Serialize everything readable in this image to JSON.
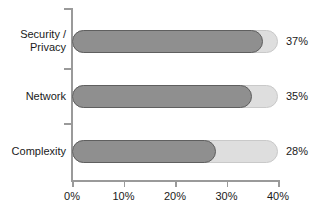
{
  "chart_data": {
    "type": "bar",
    "orientation": "horizontal",
    "title": "",
    "subtitle": "",
    "xlabel": "",
    "ylabel": "",
    "categories": [
      "Security / Privacy",
      "Network",
      "Complexity"
    ],
    "values": [
      37,
      35,
      28
    ],
    "value_labels": [
      "37%",
      "35%",
      "28%"
    ],
    "xlim": [
      0,
      40
    ],
    "xticks": [
      0,
      10,
      20,
      30,
      40
    ],
    "xtick_labels": [
      "0%",
      "10%",
      "20%",
      "30%",
      "40%"
    ],
    "grid": false,
    "legend": null,
    "colors": {
      "bar_fill": "#8f8f8f",
      "bar_outline": "#5f5f5f",
      "track_fill": "#dedede",
      "track_outline": "#c9c9c9",
      "axis": "#9a9a9a",
      "text": "#1a1a1a",
      "background": "#ffffff"
    }
  },
  "categories": {
    "security_privacy": {
      "line1": "Security /",
      "line2": "Privacy"
    },
    "network": {
      "line1": "Network"
    },
    "complexity": {
      "line1": "Complexity"
    }
  },
  "axis": {
    "ticks": [
      {
        "label": "0%"
      },
      {
        "label": "10%"
      },
      {
        "label": "20%"
      },
      {
        "label": "30%"
      },
      {
        "label": "40%"
      }
    ]
  },
  "bars": [
    {
      "category": "Security / Privacy",
      "value": 37,
      "value_label": "37%"
    },
    {
      "category": "Network",
      "value": 35,
      "value_label": "35%"
    },
    {
      "category": "Complexity",
      "value": 28,
      "value_label": "28%"
    }
  ]
}
